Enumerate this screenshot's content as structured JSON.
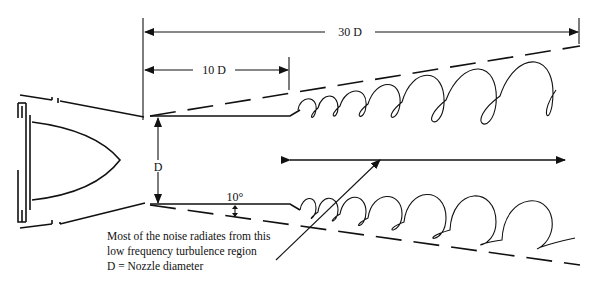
{
  "diagram": {
    "dimensions": {
      "overall_length": "30 D",
      "mixing_length": "10 D",
      "nozzle": "D",
      "spread_angle": "10°"
    },
    "caption": {
      "line1": "Most of the noise radiates from this",
      "line2": "low frequency turbulence region",
      "line3": "D = Nozzle diameter"
    },
    "colors": {
      "ink": "#111111",
      "background": "#ffffff"
    }
  }
}
